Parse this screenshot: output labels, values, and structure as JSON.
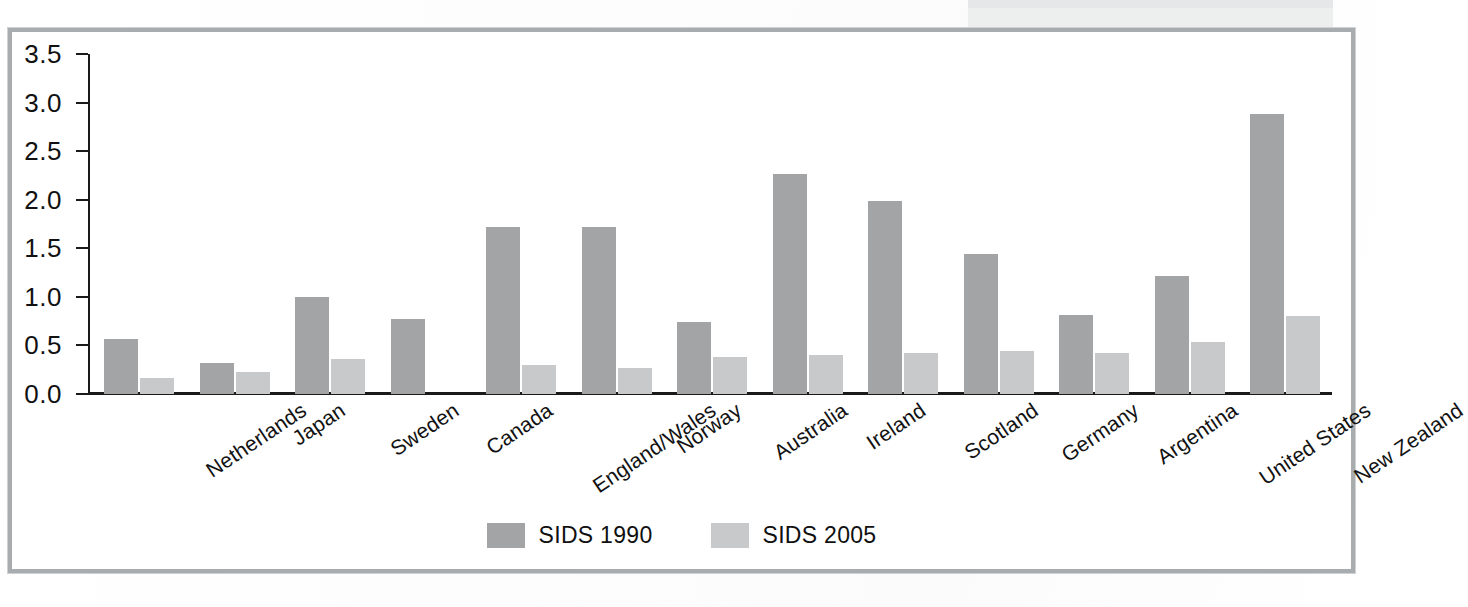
{
  "chart_data": {
    "type": "bar",
    "title": "",
    "subtitle": "",
    "xlabel": "",
    "ylabel": "",
    "ylim": [
      0.0,
      3.5
    ],
    "ytick_labels": [
      "0.0",
      "0.5",
      "1.0",
      "1.5",
      "2.0",
      "2.5",
      "3.0",
      "3.5"
    ],
    "ytick_values": [
      0.0,
      0.5,
      1.0,
      1.5,
      2.0,
      2.5,
      3.0,
      3.5
    ],
    "grid": false,
    "legend_position": "bottom-center",
    "categories": [
      "Netherlands",
      "Japan",
      "Sweden",
      "Canada",
      "England/Wales",
      "Norway",
      "Australia",
      "Ireland",
      "Scotland",
      "Germany",
      "Argentina",
      "United States",
      "New Zealand"
    ],
    "series": [
      {
        "name": "SIDS 1990",
        "color": "#a3a4a6",
        "values": [
          0.57,
          0.32,
          1.0,
          0.77,
          1.72,
          1.72,
          0.74,
          2.27,
          1.99,
          1.44,
          0.81,
          1.22,
          2.88
        ]
      },
      {
        "name": "SIDS 2005",
        "color": "#c8c9ca",
        "values": [
          0.17,
          0.23,
          0.36,
          null,
          0.3,
          0.27,
          0.38,
          0.4,
          0.42,
          0.44,
          0.42,
          0.54,
          0.8
        ]
      }
    ]
  },
  "legend": {
    "items": [
      {
        "label": "SIDS 1990",
        "color": "#a3a4a6"
      },
      {
        "label": "SIDS 2005",
        "color": "#c8c9ca"
      }
    ]
  },
  "colors": {
    "series_1990": "#a3a4a6",
    "series_2005": "#c8c9ca",
    "frame_border": "#a9acae",
    "axis": "#1a1a1a",
    "text": "#111111",
    "page_background": "#ffffff",
    "caption_artifact": "#eceded"
  }
}
